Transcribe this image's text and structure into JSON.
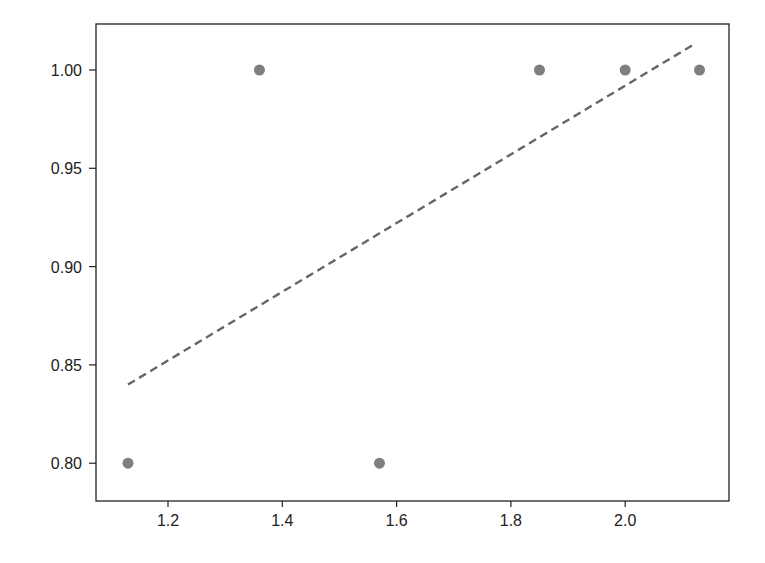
{
  "chart_data": {
    "type": "scatter",
    "title": "",
    "xlabel": "",
    "ylabel": "",
    "xlim": [
      1.075,
      2.225
    ],
    "ylim": [
      0.777,
      1.0235
    ],
    "grid": false,
    "legend": null,
    "x_ticks": [
      {
        "value": 1.2,
        "label": "1.2"
      },
      {
        "value": 1.4,
        "label": "1.4"
      },
      {
        "value": 1.6,
        "label": "1.6"
      },
      {
        "value": 1.8,
        "label": "1.8"
      },
      {
        "value": 2.0,
        "label": "2.0"
      }
    ],
    "y_ticks": [
      {
        "value": 0.8,
        "label": "0.80"
      },
      {
        "value": 0.85,
        "label": "0.85"
      },
      {
        "value": 0.9,
        "label": "0.90"
      },
      {
        "value": 0.95,
        "label": "0.95"
      },
      {
        "value": 1.0,
        "label": "1.00"
      }
    ],
    "series": [
      {
        "name": "points",
        "kind": "scatter",
        "color": "#7f7f7f",
        "x": [
          1.13,
          1.36,
          1.57,
          1.85,
          2.0,
          2.13
        ],
        "y": [
          0.8,
          1.0,
          0.8,
          1.0,
          1.0,
          1.0
        ]
      },
      {
        "name": "fit",
        "kind": "line",
        "style": "dashed",
        "color": "#666666",
        "x": [
          1.13,
          2.12
        ],
        "y": [
          0.84,
          1.013
        ]
      }
    ]
  },
  "plot": {
    "left": 96,
    "top": 24,
    "right": 729,
    "bottom": 501,
    "x_px_per_unit": 571.5,
    "x_origin_value": 1.2,
    "x_origin_px": 168,
    "y_px_per_unit": 1966,
    "y_origin_value": 1.0,
    "y_origin_px": 70
  }
}
